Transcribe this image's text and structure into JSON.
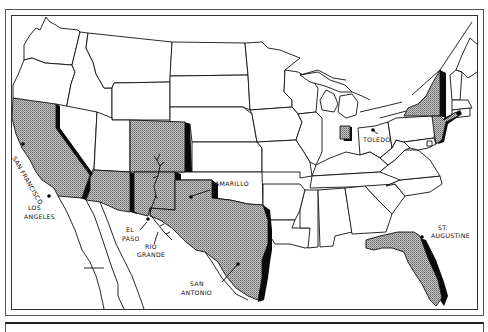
{
  "map": {
    "title": "",
    "type": "United States outline map with highlighted Spanish-influenced states",
    "colors": {
      "background": "#ffffff",
      "outline": "#111111",
      "highlight_fill": "#a9a9a9",
      "shadow": "#0a0a0a"
    },
    "highlighted_regions": [
      "California",
      "Arizona",
      "New Mexico",
      "Colorado",
      "Texas",
      "Florida",
      "Indiana",
      "New York",
      "New Jersey"
    ],
    "labels": {
      "san_francisco": "SAN FRANCISCO",
      "los_angeles_1": "LOS",
      "los_angeles_2": "ANGELES",
      "el_paso_1": "EL",
      "el_paso_2": "PASO",
      "rio_grande_1": "RIO",
      "rio_grande_2": "GRANDE",
      "amarillo": "AMARILLO",
      "san_antonio_1": "SAN",
      "san_antonio_2": "ANTONIO",
      "toledo": "TOLEDO",
      "st_augustine_1": "ST.",
      "st_augustine_2": "AUGUSTINE"
    },
    "cities": [
      {
        "name": "San Francisco",
        "icon": "city-dot"
      },
      {
        "name": "Los Angeles",
        "icon": "city-dot"
      },
      {
        "name": "El Paso",
        "icon": "city-dot"
      },
      {
        "name": "Amarillo",
        "icon": "city-dot"
      },
      {
        "name": "San Antonio",
        "icon": "city-dot"
      },
      {
        "name": "Toledo",
        "icon": "city-dot"
      },
      {
        "name": "St. Augustine",
        "icon": "city-dot"
      }
    ],
    "features": [
      "Rio Grande river"
    ]
  }
}
